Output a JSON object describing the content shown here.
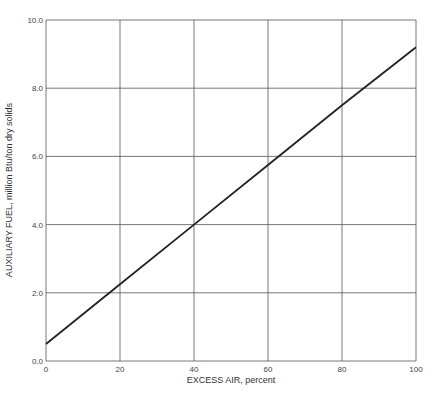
{
  "chart_data": {
    "type": "line",
    "title": "",
    "xlabel": "EXCESS AIR, percent",
    "ylabel": "AUXILIARY FUEL, million Btu/ton dry solids",
    "xlim": [
      0,
      100
    ],
    "ylim": [
      0,
      10
    ],
    "x_ticks": [
      "0",
      "20",
      "40",
      "60",
      "80",
      "100"
    ],
    "y_ticks": [
      "0.0",
      "2.0",
      "4.0",
      "6.0",
      "8.0",
      "10.0"
    ],
    "grid": true,
    "legend": null,
    "series": [
      {
        "name": "Auxiliary fuel",
        "x": [
          0,
          20,
          40,
          60,
          80,
          100
        ],
        "values": [
          0.5,
          2.25,
          4.0,
          5.75,
          7.5,
          9.2
        ]
      }
    ],
    "style": {
      "line_color": "#222222",
      "grid_color": "#555555"
    }
  }
}
